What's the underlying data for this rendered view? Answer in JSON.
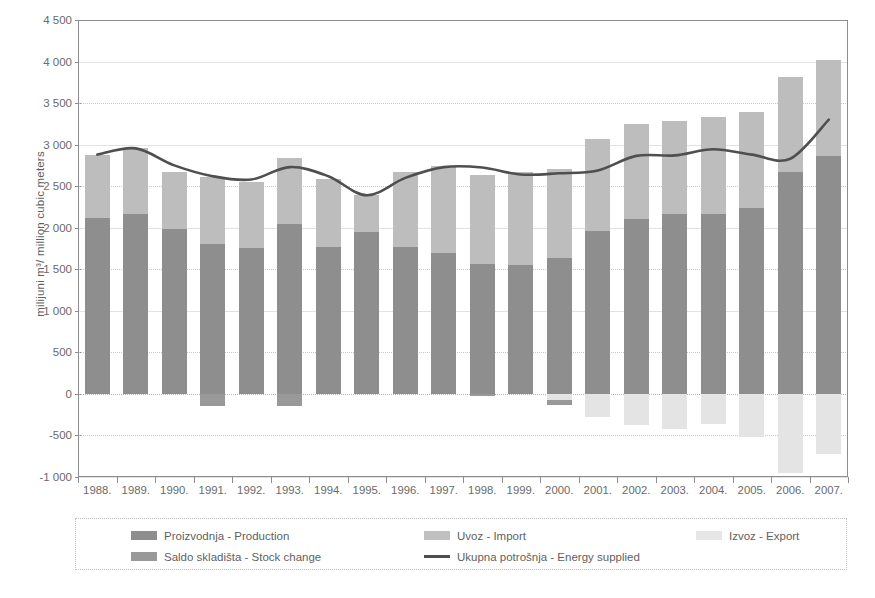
{
  "chart_data": {
    "type": "bar",
    "title": "",
    "subtitle": "",
    "xlabel": "",
    "ylabel": "milijuni m³/ million cubic meters",
    "ylim": [
      -1000,
      4500
    ],
    "ytick_step": 500,
    "yticks": [
      -1000,
      -500,
      0,
      500,
      1000,
      1500,
      2000,
      2500,
      3000,
      3500,
      4000,
      4500
    ],
    "ytick_labels": [
      "-1 000",
      "-500",
      "0",
      "500",
      "1 000",
      "1 500",
      "2 000",
      "2 500",
      "3 000",
      "3 500",
      "4 000",
      "4 500"
    ],
    "grid": true,
    "legend_position": "bottom",
    "stacked": true,
    "categories": [
      "1988.",
      "1989.",
      "1990.",
      "1991.",
      "1992.",
      "1993.",
      "1994.",
      "1995.",
      "1996.",
      "1997.",
      "1998.",
      "1999.",
      "2000.",
      "2001.",
      "2002.",
      "2003.",
      "2004.",
      "2005.",
      "2006.",
      "2007."
    ],
    "series": [
      {
        "name": "Proizvodnja - Production",
        "key": "production",
        "color": "#8e8e8e",
        "values": [
          2120,
          2170,
          1980,
          1800,
          1760,
          2040,
          1770,
          1950,
          1770,
          1700,
          1560,
          1550,
          1630,
          1960,
          2110,
          2160,
          2160,
          2240,
          2670,
          2860
        ]
      },
      {
        "name": "Uvoz - Import",
        "key": "import",
        "color": "#bdbdbd",
        "values": [
          760,
          790,
          690,
          810,
          790,
          800,
          820,
          440,
          900,
          1040,
          1080,
          1120,
          1080,
          1110,
          1140,
          1130,
          1170,
          1150,
          1145,
          1160
        ]
      },
      {
        "name": "Izvoz - Export",
        "key": "export",
        "color": "#e4e4e4",
        "values": [
          0,
          0,
          0,
          0,
          0,
          0,
          0,
          0,
          0,
          0,
          0,
          0,
          -70,
          -280,
          -370,
          -420,
          -360,
          -520,
          -950,
          -720
        ]
      },
      {
        "name": "Saldo skladišta - Stock change",
        "key": "stock_change",
        "color": "#999999",
        "values": [
          0,
          0,
          0,
          -150,
          0,
          -150,
          0,
          0,
          0,
          0,
          -20,
          0,
          -60,
          0,
          0,
          0,
          0,
          0,
          0,
          0
        ]
      },
      {
        "name": "Ukupna potrošnja - Energy supplied",
        "key": "energy_supplied",
        "color": "#4f4f4f",
        "type": "line",
        "values": [
          2880,
          2955,
          2750,
          2620,
          2580,
          2730,
          2620,
          2390,
          2600,
          2730,
          2725,
          2640,
          2655,
          2690,
          2865,
          2870,
          2945,
          2880,
          2830,
          3300
        ]
      }
    ]
  },
  "legend": {
    "items": [
      {
        "label": "Proizvodnja - Production",
        "swatch": "prod",
        "icon": "legend-swatch-production"
      },
      {
        "label": "Uvoz - Import",
        "swatch": "imp",
        "icon": "legend-swatch-import"
      },
      {
        "label": "Izvoz - Export",
        "swatch": "exp",
        "icon": "legend-swatch-export"
      },
      {
        "label": "Saldo skladišta - Stock change",
        "swatch": "stock",
        "icon": "legend-swatch-stock-change"
      },
      {
        "label": "Ukupna potrošnja - Energy supplied",
        "swatch": "line",
        "icon": "legend-line-energy-supplied"
      }
    ]
  }
}
